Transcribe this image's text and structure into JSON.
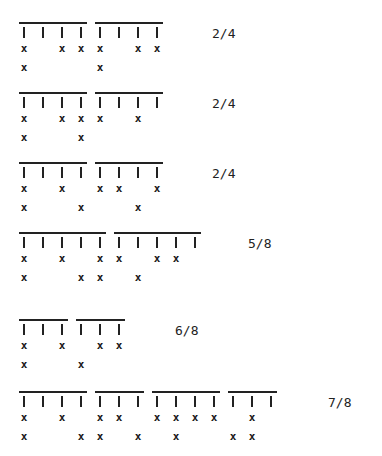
{
  "diagram": {
    "slot_spacing_px": 19,
    "rows": [
      {
        "meter": "2/4",
        "groups": [
          4,
          4
        ],
        "upper": [
          1,
          3,
          4,
          5,
          7,
          8
        ],
        "lower": [
          1,
          5
        ]
      },
      {
        "meter": "2/4",
        "groups": [
          4,
          4
        ],
        "upper": [
          1,
          3,
          4,
          5,
          7
        ],
        "lower": [
          1,
          4
        ]
      },
      {
        "meter": "2/4",
        "groups": [
          4,
          4
        ],
        "upper": [
          1,
          3,
          5,
          6,
          8
        ],
        "lower": [
          1,
          4,
          7
        ]
      },
      {
        "meter": "5/8",
        "groups": [
          5,
          5
        ],
        "upper": [
          1,
          3,
          5,
          6,
          8,
          9
        ],
        "lower": [
          1,
          4,
          5,
          7
        ]
      },
      {
        "meter": "6/8",
        "groups": [
          3,
          3
        ],
        "upper": [
          1,
          3,
          5,
          6
        ],
        "lower": [
          1,
          4
        ]
      },
      {
        "meter": "7/8",
        "groups": [
          4,
          3,
          4,
          3
        ],
        "upper": [
          1,
          3,
          5,
          6,
          8,
          9,
          10,
          11,
          13
        ],
        "lower": [
          1,
          4,
          5,
          7,
          9,
          12,
          13
        ]
      }
    ],
    "mark_glyph": "x",
    "tick_glyph": "|"
  },
  "layout": {
    "row_tops": [
      22,
      92,
      162,
      232,
      319,
      391
    ],
    "label_pos": [
      [
        212,
        26
      ],
      [
        212,
        96
      ],
      [
        212,
        166
      ],
      [
        248,
        236
      ],
      [
        175,
        323
      ],
      [
        328,
        395
      ]
    ]
  }
}
